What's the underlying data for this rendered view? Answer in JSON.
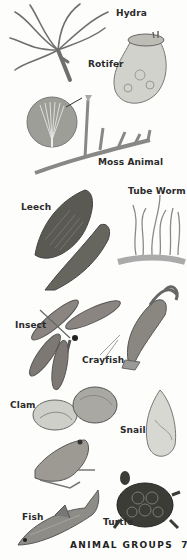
{
  "page": {
    "footer_title": "ANIMAL GROUPS",
    "page_number": "75"
  },
  "labels": {
    "hydra": "Hydra",
    "rotifer": "Rotifer",
    "moss_animal": "Moss Animal",
    "leech": "Leech",
    "tube_worm": "Tube Worm",
    "insect": "Insect",
    "crayfish": "Crayfish",
    "clam": "Clam",
    "snail": "Snail",
    "fish": "Fish",
    "turtle": "Turtle"
  },
  "colors": {
    "background": "#fdfdfb",
    "ink": "#2b2b2b",
    "illustration_gray": "#7a7a7a",
    "illustration_dark": "#4a4a4a"
  }
}
